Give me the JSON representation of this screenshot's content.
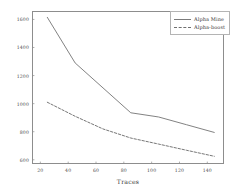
{
  "chart_data": {
    "type": "line",
    "title": "",
    "xlabel": "Traces",
    "ylabel": "",
    "xlim": [
      14,
      152
    ],
    "ylim": [
      570,
      1660
    ],
    "xticks": [
      20,
      40,
      60,
      80,
      100,
      120,
      140
    ],
    "yticks": [
      600,
      800,
      1000,
      1200,
      1400,
      1600
    ],
    "grid": false,
    "legend_position": "upper right",
    "series": [
      {
        "name": "Alpha Mine",
        "style": "solid",
        "color": "#7b7b7b",
        "x": [
          25,
          45,
          85,
          105,
          125,
          145
        ],
        "values": [
          1615,
          1290,
          935,
          905,
          850,
          795
        ]
      },
      {
        "name": "Alpha-boost",
        "style": "dashed",
        "color": "#6f6f6f",
        "x": [
          25,
          45,
          65,
          85,
          105,
          125,
          145
        ],
        "values": [
          1010,
          910,
          820,
          755,
          712,
          668,
          625
        ]
      }
    ]
  },
  "axes": {
    "xtick_labels": [
      "20",
      "40",
      "60",
      "80",
      "100",
      "120",
      "140"
    ],
    "ytick_labels": [
      "600",
      "800",
      "1000",
      "1200",
      "1400",
      "1600"
    ],
    "xlabel": "Traces"
  },
  "legend": {
    "entries": [
      {
        "label": "Alpha Mine",
        "style": "solid"
      },
      {
        "label": "Alpha-boost",
        "style": "dashed"
      }
    ]
  }
}
